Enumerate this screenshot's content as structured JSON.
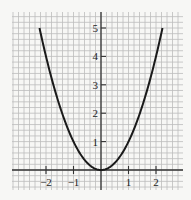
{
  "chart_data": {
    "type": "line",
    "title": "",
    "xlabel": "",
    "ylabel": "",
    "function": "y = x^2",
    "xlim": [
      -2.236,
      2.236
    ],
    "ylim": [
      0,
      5
    ],
    "grid": true,
    "grid_subdivisions_per_unit": 5,
    "x_ticks": [
      "-2",
      "-1",
      "1",
      "2"
    ],
    "y_ticks": [
      "1",
      "2",
      "3",
      "4",
      "5"
    ],
    "series": [
      {
        "name": "y = x^2",
        "x": [
          -2.236,
          -2,
          -1.5,
          -1,
          -0.5,
          0,
          0.5,
          1,
          1.5,
          2,
          2.236
        ],
        "y": [
          5,
          4,
          2.25,
          1,
          0.25,
          0,
          0.25,
          1,
          2.25,
          4,
          5
        ]
      }
    ],
    "legend": "none"
  },
  "colors": {
    "background": "#f7f7f5",
    "grid": "#bdbdbd",
    "axis": "#333333",
    "curve": "#1a1a1a"
  },
  "layout": {
    "origin_px": [
      101,
      170
    ],
    "x_unit_px": 27.5,
    "y_unit_px": 28.4,
    "grid_left": 12,
    "grid_right": 183,
    "grid_top": 12,
    "grid_bottom": 190
  }
}
